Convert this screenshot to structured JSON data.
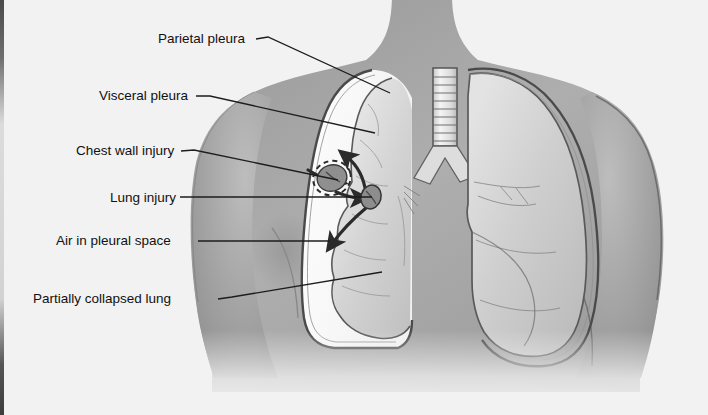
{
  "figure": {
    "view": "anterior chest, cutaway",
    "background_color": "#f2f2f2",
    "ink_color": "#2a2a2a",
    "skin_color": "#a9a9a9",
    "air_space_color": "#fbfbfb",
    "lung_color": "#d4d4d4"
  },
  "labels": [
    {
      "id": "parietal-pleura",
      "text": "Parietal pleura",
      "x": 158,
      "y": 43,
      "anchor": "start",
      "leader": [
        [
          256,
          39
        ],
        [
          268,
          37
        ],
        [
          390,
          93
        ]
      ]
    },
    {
      "id": "visceral-pleura",
      "text": "Visceral pleura",
      "x": 99,
      "y": 100,
      "anchor": "start",
      "leader": [
        [
          196,
          96
        ],
        [
          210,
          96
        ],
        [
          375,
          133
        ]
      ]
    },
    {
      "id": "chest-wall-injury",
      "text": "Chest wall injury",
      "x": 76,
      "y": 155,
      "anchor": "start",
      "leader": [
        [
          181,
          151
        ],
        [
          194,
          150
        ],
        [
          338,
          180
        ]
      ]
    },
    {
      "id": "lung-injury",
      "text": "Lung injury",
      "x": 110,
      "y": 202,
      "anchor": "start",
      "leader": [
        [
          180,
          197
        ],
        [
          372,
          197
        ]
      ]
    },
    {
      "id": "air-in-pleural-space",
      "text": "Air in pleural space",
      "x": 56,
      "y": 245,
      "anchor": "start",
      "leader": [
        [
          198,
          241
        ],
        [
          330,
          241
        ]
      ]
    },
    {
      "id": "partially-collapsed-lung",
      "text": "Partially collapsed lung",
      "x": 33,
      "y": 303,
      "anchor": "start",
      "leader": [
        [
          218,
          299
        ],
        [
          232,
          297
        ],
        [
          382,
          272
        ]
      ]
    }
  ],
  "structures": [
    {
      "id": "torso",
      "label": "Torso, head and shoulders"
    },
    {
      "id": "neck",
      "label": "Neck"
    },
    {
      "id": "left-shoulder",
      "label": "Left shoulder and arm"
    },
    {
      "id": "right-shoulder",
      "label": "Right shoulder and arm"
    },
    {
      "id": "trachea",
      "label": "Trachea"
    },
    {
      "id": "carina-bronchi",
      "label": "Carina and main bronchi"
    },
    {
      "id": "intact-lung",
      "label": "Intact lung"
    },
    {
      "id": "collapsed-lung",
      "label": "Partially collapsed lung"
    },
    {
      "id": "pleural-air-space",
      "label": "Air in pleural space"
    },
    {
      "id": "parietal-pleura-line",
      "label": "Parietal pleura membrane"
    },
    {
      "id": "chest-wall-wound",
      "label": "Chest wall injury (open wound)"
    },
    {
      "id": "lung-wound",
      "label": "Lung injury (laceration)"
    }
  ],
  "arrows": [
    {
      "id": "arrow-into-wound",
      "meaning": "Air entering through chest wall injury"
    },
    {
      "id": "arrow-up-apex",
      "meaning": "Air rising toward the lung apex"
    },
    {
      "id": "arrow-down-base",
      "meaning": "Air descending toward the lung base"
    }
  ],
  "artifacts": {
    "left_edge_strip": "dark scan edge along the left margin"
  }
}
